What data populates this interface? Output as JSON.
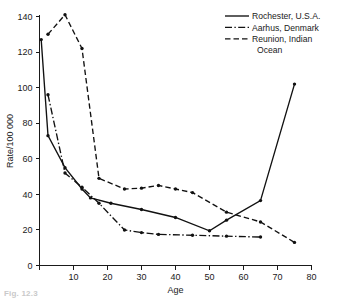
{
  "figure": {
    "caption_partial": "Fig. 12.3"
  },
  "chart_data": {
    "type": "line",
    "title": "",
    "xlabel": "Age",
    "ylabel": "Rate/100 000",
    "xlim": [
      0,
      80
    ],
    "ylim": [
      0,
      140
    ],
    "xticks": [
      0,
      10,
      20,
      30,
      40,
      50,
      60,
      70,
      80
    ],
    "xtick_labels": [
      "0",
      "10",
      "20",
      "30",
      "40",
      "50",
      "60",
      "70",
      "80"
    ],
    "yticks": [
      0,
      20,
      40,
      60,
      80,
      100,
      120,
      140
    ],
    "ytick_labels": [
      "0",
      "20",
      "40",
      "60",
      "80",
      "100",
      "120",
      "140"
    ],
    "grid": false,
    "legend_position": "top-right",
    "series": [
      {
        "name": "Rochester, U.S.A.",
        "line_style": "solid",
        "x": [
          0.5,
          2.5,
          7.5,
          12.5,
          15,
          21,
          30,
          40,
          50,
          55,
          65,
          75
        ],
        "y": [
          127,
          73,
          55,
          43,
          38,
          35,
          31.5,
          27,
          19.5,
          25.5,
          36.5,
          102
        ]
      },
      {
        "name": "Aarhus, Denmark",
        "line_style": "dash-dot",
        "x": [
          2.5,
          7.5,
          12.5,
          17.5,
          25,
          30,
          35,
          45,
          55,
          65
        ],
        "y": [
          96,
          52,
          44,
          35,
          20,
          18.5,
          17.5,
          17,
          16.5,
          16
        ]
      },
      {
        "name": "Reunion, Indian Ocean",
        "line_style": "dashed",
        "x": [
          2.5,
          7.5,
          12.5,
          17.5,
          25,
          30,
          35,
          40,
          45,
          55,
          65,
          75
        ],
        "y": [
          130,
          141,
          122,
          49,
          43,
          43.5,
          45,
          43,
          41,
          30,
          24.5,
          13
        ]
      }
    ]
  },
  "legend": {
    "entries": [
      {
        "label": "Rochester, U.S.A.",
        "style": "solid"
      },
      {
        "label": "Aarhus, Denmark",
        "style": "dash-dot"
      },
      {
        "label": "Reunion, Indian",
        "style": "dashed"
      },
      {
        "label": "Ocean",
        "style": "none"
      }
    ]
  }
}
